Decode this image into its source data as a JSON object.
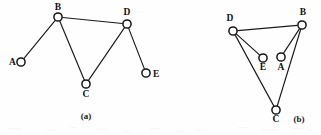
{
  "figure": {
    "background_color": "#fefefe",
    "edge_color": "#1a1a1a",
    "node_fill": "#fdfdfd",
    "node_stroke": "#151515",
    "label_color": "#111111",
    "node_radius": 4.1,
    "width": 321,
    "height": 135
  },
  "chart_data": {
    "type": "diagram",
    "subtype": "node-link-graph",
    "panels": [
      {
        "id": "panel-a",
        "caption": "(a)",
        "caption_x": 86,
        "caption_y": 119,
        "nodes": [
          {
            "id": "A",
            "label": "A",
            "x": 21,
            "y": 62,
            "label_x": 9,
            "label_y": 65,
            "label_anchor": "start"
          },
          {
            "id": "B",
            "label": "B",
            "x": 58,
            "y": 17,
            "label_x": 58,
            "label_y": 10,
            "label_anchor": "middle"
          },
          {
            "id": "C",
            "label": "C",
            "x": 86,
            "y": 84,
            "label_x": 86,
            "label_y": 97,
            "label_anchor": "middle"
          },
          {
            "id": "D",
            "label": "D",
            "x": 127,
            "y": 24,
            "label_x": 127,
            "label_y": 15,
            "label_anchor": "middle"
          },
          {
            "id": "E",
            "label": "E",
            "x": 146,
            "y": 73,
            "label_x": 153,
            "label_y": 77,
            "label_anchor": "start"
          }
        ],
        "edges": [
          {
            "from": "A",
            "to": "B"
          },
          {
            "from": "B",
            "to": "D"
          },
          {
            "from": "B",
            "to": "C"
          },
          {
            "from": "C",
            "to": "D"
          },
          {
            "from": "D",
            "to": "E"
          }
        ]
      },
      {
        "id": "panel-b",
        "caption": "(b)",
        "caption_x": 299,
        "caption_y": 122,
        "nodes": [
          {
            "id": "D",
            "label": "D",
            "x": 233,
            "y": 31,
            "label_x": 230,
            "label_y": 21,
            "label_anchor": "middle"
          },
          {
            "id": "B",
            "label": "B",
            "x": 302,
            "y": 25,
            "label_x": 303,
            "label_y": 15,
            "label_anchor": "middle"
          },
          {
            "id": "E",
            "label": "E",
            "x": 263,
            "y": 58,
            "label_x": 263,
            "label_y": 70,
            "label_anchor": "middle"
          },
          {
            "id": "A",
            "label": "A",
            "x": 281,
            "y": 57,
            "label_x": 281,
            "label_y": 70,
            "label_anchor": "middle"
          },
          {
            "id": "C",
            "label": "C",
            "x": 276,
            "y": 110,
            "label_x": 276,
            "label_y": 122,
            "label_anchor": "middle"
          }
        ],
        "edges": [
          {
            "from": "D",
            "to": "B"
          },
          {
            "from": "D",
            "to": "E"
          },
          {
            "from": "D",
            "to": "C"
          },
          {
            "from": "B",
            "to": "A"
          },
          {
            "from": "B",
            "to": "C"
          }
        ]
      }
    ],
    "vertex_set": [
      "A",
      "B",
      "C",
      "D",
      "E"
    ],
    "edge_set": [
      "A-B",
      "B-C",
      "B-D",
      "C-D",
      "D-E"
    ],
    "note": "Panels (a) and (b) show the same 5-vertex, 5-edge graph drawn two different ways"
  }
}
